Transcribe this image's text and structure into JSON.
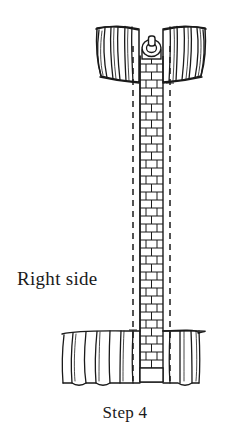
{
  "illustration": {
    "title": "zipper-installation-diagram",
    "style": "hand-drawn line art",
    "ink_color": "#1a1a1a",
    "background_color": "#ffffff",
    "parts": {
      "collar_fan": "gathered fan of fabric pleats at top",
      "zipper_tape": "vertical zipper with staggered brick-pattern teeth",
      "zipper_pull": "ring pull with rectangular tab",
      "stitch_lines": "two vertical dashed stitching lines flanking the zipper",
      "hem_gathers": "gathered fabric pleats at bottom hem"
    }
  },
  "labels": {
    "right_side": "Right side",
    "step": "Step 4"
  }
}
